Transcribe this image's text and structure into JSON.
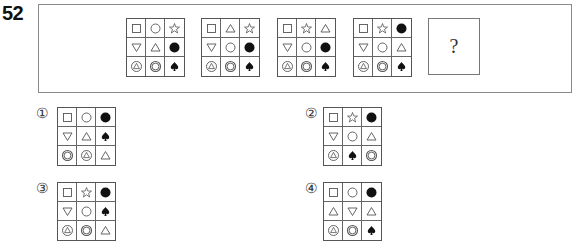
{
  "question": {
    "number": "52",
    "unknown_label": "?"
  },
  "sequence": [
    {
      "cells": [
        "square",
        "circle",
        "star",
        "triangle-down",
        "triangle-up",
        "filled-circle",
        "circle-triangle",
        "double-circle",
        "spade"
      ]
    },
    {
      "cells": [
        "square",
        "triangle-up",
        "star",
        "triangle-down",
        "circle",
        "filled-circle",
        "circle-triangle",
        "double-circle",
        "spade"
      ]
    },
    {
      "cells": [
        "square",
        "star",
        "triangle-up",
        "triangle-down",
        "circle",
        "filled-circle",
        "circle-triangle",
        "double-circle",
        "spade"
      ]
    },
    {
      "cells": [
        "square",
        "star",
        "filled-circle",
        "triangle-down",
        "circle",
        "triangle-up",
        "circle-triangle",
        "double-circle",
        "spade"
      ]
    }
  ],
  "options": [
    {
      "label": "①",
      "cells": [
        "square",
        "circle",
        "filled-circle",
        "triangle-down",
        "triangle-up",
        "spade",
        "double-circle",
        "circle-triangle",
        "triangle-up"
      ]
    },
    {
      "label": "②",
      "cells": [
        "square",
        "star",
        "filled-circle",
        "triangle-down",
        "circle",
        "triangle-up",
        "circle-triangle",
        "spade",
        "double-circle"
      ]
    },
    {
      "label": "③",
      "cells": [
        "square",
        "star",
        "filled-circle",
        "triangle-down",
        "circle",
        "spade",
        "circle-triangle",
        "double-circle",
        "triangle-up"
      ]
    },
    {
      "label": "④",
      "cells": [
        "square",
        "circle",
        "filled-circle",
        "triangle-up",
        "triangle-down",
        "triangle-up",
        "circle-triangle",
        "double-circle",
        "spade"
      ]
    }
  ],
  "colors": {
    "stroke": "#555555",
    "fill": "#111111",
    "border": "#666666"
  }
}
